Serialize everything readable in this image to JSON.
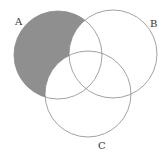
{
  "diagram": {
    "type": "venn",
    "shaded_region": "A only (A minus B minus C)",
    "colors": {
      "shade": "#8f8f8f",
      "stroke": "#8a8a8a",
      "label": "#333333"
    },
    "circles": [
      {
        "id": "A",
        "label": "A",
        "cx": 58,
        "cy": 55,
        "r": 44,
        "label_x": 15,
        "label_y": 25
      },
      {
        "id": "B",
        "label": "B",
        "cx": 113,
        "cy": 54,
        "r": 44,
        "label_x": 150,
        "label_y": 27
      },
      {
        "id": "C",
        "label": "C",
        "cx": 88,
        "cy": 94,
        "r": 43,
        "label_x": 98,
        "label_y": 149
      }
    ]
  }
}
